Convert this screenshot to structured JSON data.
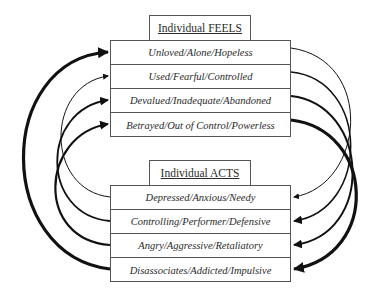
{
  "feels": {
    "title": "Individual FEELS",
    "items": [
      "Unloved/Alone/Hopeless",
      "Used/Fearful/Controlled",
      "Devalued/Inadequate/Abandoned",
      "Betrayed/Out of Control/Powerless"
    ]
  },
  "acts": {
    "title": "Individual ACTS",
    "items": [
      "Depressed/Anxious/Needy",
      "Controlling/Performer/Defensive",
      "Angry/Aggressive/Retaliatory",
      "Disassociates/Addicted/Impulsive"
    ]
  },
  "colors": {
    "line": "#111111",
    "border": "#555555"
  }
}
